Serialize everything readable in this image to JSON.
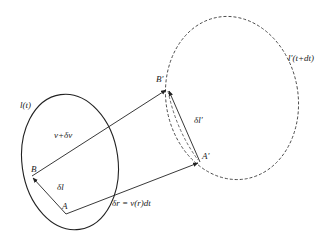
{
  "diagram": {
    "colors": {
      "stroke": "#222222",
      "background": "#ffffff"
    },
    "curves": {
      "initial": {
        "label": "l(t)",
        "style": "solid",
        "cx": 70,
        "cy": 162,
        "rx": 48,
        "ry": 68,
        "rotate": -8
      },
      "final": {
        "label": "l′(t+dt)",
        "style": "dashed",
        "cx": 232,
        "cy": 98,
        "rx": 66,
        "ry": 82,
        "rotate": -10
      }
    },
    "points": {
      "A": {
        "label": "A",
        "x": 66,
        "y": 214
      },
      "B": {
        "label": "B",
        "x": 32,
        "y": 176
      },
      "A_prime": {
        "label": "A′",
        "x": 200,
        "y": 162
      },
      "B_prime": {
        "label": "B′",
        "x": 168,
        "y": 89
      }
    },
    "vectors": {
      "v_plus_dv": {
        "label": "v+δv",
        "from": "B",
        "to": "B_prime"
      },
      "dr": {
        "label": "δr = v(r)dt",
        "from": "A",
        "to": "A_prime"
      },
      "dl": {
        "label": "δl",
        "from": "A",
        "to": "B"
      },
      "dl_prime": {
        "label": "δl′",
        "from": "A_prime",
        "to": "B_prime"
      }
    },
    "labels": {
      "l_t": "l(t)",
      "l_prime": "l′(t+dt)",
      "v_dv": "v+δv",
      "dl": "δl",
      "dl_prime": "δl′",
      "dr": "δr = v(r)dt",
      "A": "A",
      "B": "B",
      "A_prime": "A′",
      "B_prime": "B′"
    }
  }
}
